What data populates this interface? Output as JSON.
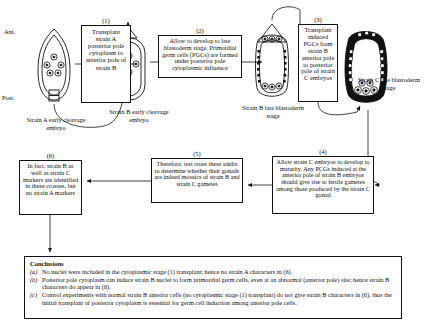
{
  "diagram": {
    "orientation": {
      "anterior": "Ant.",
      "posterior": "Post."
    },
    "steps": [
      {
        "num": "(1)",
        "text": "Transplant strain A posterior pole cytoplasm to anterior pole of strain B"
      },
      {
        "num": "(2)",
        "text": "Allow to develop to late blastoderm stage. Primordial germ cells (PGCs) are formed under posterior pole cytoplasmic influence"
      },
      {
        "num": "(3)",
        "text": "Transplant induced PGCs from strain B anterior pole to posterior pole of strain C embryos"
      },
      {
        "num": "(4)",
        "text": "Allow strain C embryos to develop to maturity. Any PCGs induced at the anterior pole of strain B embryos should give rise to fertile gametes among those produced by the strain C gonad"
      },
      {
        "num": "(5)",
        "text": "Therefore, test cross these adults to determine whether their gonads are indeed mosaics of strain B and strain C gametes"
      },
      {
        "num": "(6)",
        "text": "In fact, strain B as well as strain C markers are identified in these crosses, but no strain A markers"
      }
    ],
    "embryo_labels": [
      {
        "id": "strain-a",
        "text": "Strain A early cleavage embryo"
      },
      {
        "id": "strain-b",
        "text": "Strain B early cleavage embryo"
      },
      {
        "id": "strain-b-late",
        "text": "Strain B late blastoderm stage"
      },
      {
        "id": "strain-c-late",
        "text": "Strain C late blastoderm stage"
      }
    ]
  },
  "conclusions": {
    "heading": "Conclusions",
    "items": [
      {
        "marker": "(a)",
        "text": "No nuclei were included in the cytoplasmic stage (1) transplant; hence no strain A characters in (6)."
      },
      {
        "marker": "(b)",
        "text": "Posterior pole cytoplasm can induce strain B nuclei to form primordial germ cells, even at an abnormal (anterior pole) site; hence strain B characters do appear in (6)."
      },
      {
        "marker": "(c)",
        "text": "Control experiments with normal strain B anterior cells (no cytoplasmic stage (1) transplant) do not give strain B characters in (6), thus the initial transplant of posterior cytoplasm is essential for germ cell induction among anterior pole cells."
      }
    ]
  },
  "colors": {
    "ink": "#111111",
    "page": "#ffffff"
  }
}
